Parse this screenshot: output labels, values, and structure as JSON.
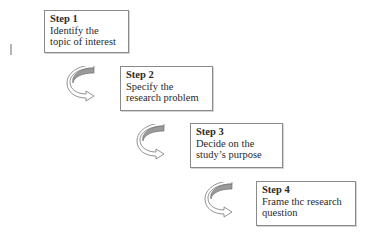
{
  "steps": [
    {
      "title": "Step 1",
      "lines": [
        "Identify the",
        "topic of interest"
      ]
    },
    {
      "title": "Step 2",
      "lines": [
        "Specify the",
        "research problem"
      ]
    },
    {
      "title": "Step 3",
      "lines": [
        "Decide on the",
        "study’s purpose"
      ]
    },
    {
      "title": "Step 4",
      "lines": [
        "Frame thc research",
        "question"
      ]
    }
  ],
  "arrows": [
    {
      "icon": "curved-arrow-icon"
    },
    {
      "icon": "curved-arrow-icon"
    },
    {
      "icon": "curved-arrow-icon"
    }
  ],
  "colors": {
    "border": "#8a8a8a",
    "arrow_fill": "#9a9a9a",
    "text": "#2a2a2a"
  }
}
